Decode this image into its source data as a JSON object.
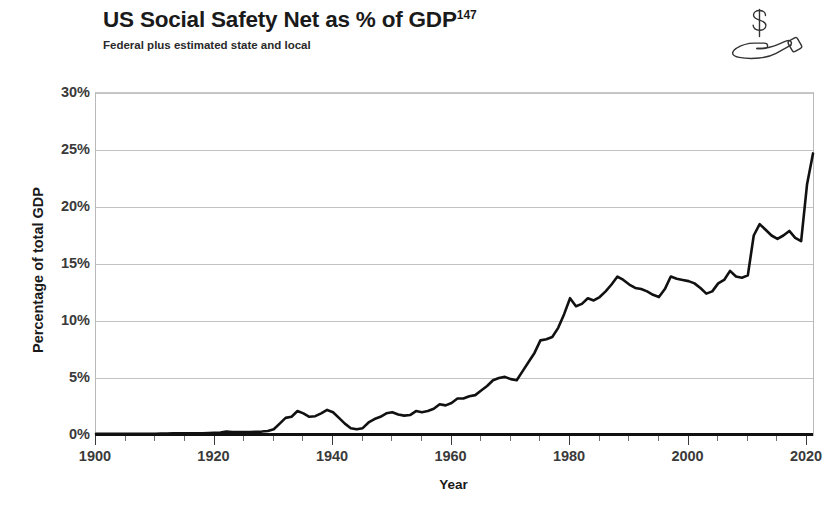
{
  "header": {
    "title_main": "US Social Safety Net as % of GDP",
    "title_superscript": "147",
    "subtitle": "Federal plus estimated state and local",
    "icon": "hand-holding-dollar-icon"
  },
  "axes": {
    "y_title": "Percentage of total GDP",
    "x_title": "Year",
    "y_ticks": [
      "0%",
      "5%",
      "10%",
      "15%",
      "20%",
      "25%",
      "30%"
    ],
    "x_ticks": [
      "1900",
      "1920",
      "1940",
      "1960",
      "1980",
      "2000",
      "2020"
    ]
  },
  "footnote": "",
  "colors": {
    "line": "#111111",
    "grid": "#c2c2c2",
    "frame": "#b9b9b9",
    "text": "#1a1a1a",
    "tick_text": "#3a3a3a",
    "background": "#ffffff"
  },
  "chart_data": {
    "type": "line",
    "title": "US Social Safety Net as % of GDP",
    "subtitle": "Federal plus estimated state and local",
    "xlabel": "Year",
    "ylabel": "Percentage of total GDP",
    "xlim": [
      1900,
      2021
    ],
    "ylim": [
      0,
      30
    ],
    "y_tick_values": [
      0,
      5,
      10,
      15,
      20,
      25,
      30
    ],
    "y_tick_labels": [
      "0%",
      "5%",
      "10%",
      "15%",
      "20%",
      "25%",
      "30%"
    ],
    "x_tick_values": [
      1900,
      1920,
      1940,
      1960,
      1980,
      2000,
      2020
    ],
    "x_minor_tick_interval": 5,
    "grid": "horizontal",
    "legend": "none",
    "units": "percent of total GDP",
    "series": [
      {
        "name": "US Social Safety Net as % of GDP",
        "x": [
          1900,
          1901,
          1902,
          1903,
          1904,
          1905,
          1906,
          1907,
          1908,
          1909,
          1910,
          1911,
          1912,
          1913,
          1914,
          1915,
          1916,
          1917,
          1918,
          1919,
          1920,
          1921,
          1922,
          1923,
          1924,
          1925,
          1926,
          1927,
          1928,
          1929,
          1930,
          1931,
          1932,
          1933,
          1934,
          1935,
          1936,
          1937,
          1938,
          1939,
          1940,
          1941,
          1942,
          1943,
          1944,
          1945,
          1946,
          1947,
          1948,
          1949,
          1950,
          1951,
          1952,
          1953,
          1954,
          1955,
          1956,
          1957,
          1958,
          1959,
          1960,
          1961,
          1962,
          1963,
          1964,
          1965,
          1966,
          1967,
          1968,
          1969,
          1970,
          1971,
          1972,
          1973,
          1974,
          1975,
          1976,
          1977,
          1978,
          1979,
          1980,
          1981,
          1982,
          1983,
          1984,
          1985,
          1986,
          1987,
          1988,
          1989,
          1990,
          1991,
          1992,
          1993,
          1994,
          1995,
          1996,
          1997,
          1998,
          1999,
          2000,
          2001,
          2002,
          2003,
          2004,
          2005,
          2006,
          2007,
          2008,
          2009,
          2010,
          2011,
          2012,
          2013,
          2014,
          2015,
          2016,
          2017,
          2018,
          2019,
          2020,
          2021
        ],
        "values": [
          0.1,
          0.1,
          0.1,
          0.1,
          0.1,
          0.1,
          0.1,
          0.1,
          0.1,
          0.1,
          0.1,
          0.12,
          0.13,
          0.14,
          0.15,
          0.15,
          0.15,
          0.15,
          0.16,
          0.18,
          0.2,
          0.22,
          0.3,
          0.25,
          0.25,
          0.25,
          0.25,
          0.28,
          0.3,
          0.35,
          0.5,
          1.0,
          1.5,
          1.6,
          2.1,
          1.9,
          1.6,
          1.65,
          1.9,
          2.2,
          2.0,
          1.5,
          1.0,
          0.6,
          0.5,
          0.6,
          1.1,
          1.4,
          1.6,
          1.9,
          2.0,
          1.8,
          1.7,
          1.75,
          2.1,
          2.0,
          2.1,
          2.3,
          2.7,
          2.6,
          2.8,
          3.2,
          3.2,
          3.4,
          3.5,
          3.9,
          4.3,
          4.8,
          5.0,
          5.1,
          4.9,
          4.8,
          5.6,
          6.4,
          7.2,
          8.3,
          8.4,
          8.6,
          9.4,
          10.6,
          12.0,
          11.3,
          11.5,
          12.0,
          11.8,
          12.1,
          12.6,
          13.2,
          13.9,
          13.6,
          13.2,
          12.9,
          12.8,
          12.6,
          12.3,
          12.1,
          12.8,
          13.9,
          13.7,
          13.6,
          13.5,
          13.3,
          12.9,
          12.4,
          12.6,
          13.3,
          13.6,
          14.4,
          13.9,
          13.8,
          14.0,
          17.5,
          18.5,
          18.0,
          17.5,
          17.2,
          17.5,
          17.9,
          17.3,
          17.0,
          22.0,
          24.7
        ]
      }
    ],
    "annotations": [
      {
        "label": "flat near zero",
        "x_range": [
          1900,
          1928
        ],
        "value": 0.1
      },
      {
        "label": "New Deal peak",
        "x": 1939,
        "value": 2.2
      },
      {
        "label": "WWII trough",
        "x": 1944,
        "value": 0.5
      },
      {
        "label": "Great Society rise",
        "x_range": [
          1965,
          1976
        ],
        "value_range": [
          3.9,
          8.6
        ]
      },
      {
        "label": "1980s plateau",
        "x": 1982,
        "value": 11.5
      },
      {
        "label": "Great Recession jump",
        "x": 2010,
        "value": 18.5
      },
      {
        "label": "COVID-19 spike",
        "x": 2021,
        "value": 24.7
      }
    ]
  }
}
